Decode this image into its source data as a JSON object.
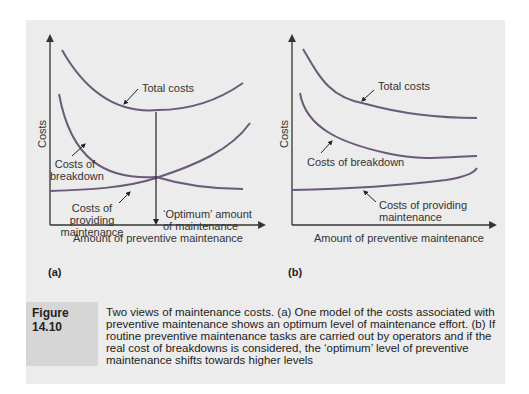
{
  "figure": {
    "label": "Figure 14.10",
    "caption": "Two views of maintenance costs. (a) One model of the costs associated with preventive maintenance shows an optimum level of maintenance effort. (b) If routine preventive maintenance tasks are carried out by operators and if the real cost of breakdowns is considered, the ‘optimum’ level of preventive maintenance shifts towards higher levels"
  },
  "panel_a": {
    "sublabel": "(a)",
    "y_axis_label": "Costs",
    "x_axis_label": "Amount of preventive maintenance",
    "curve_labels": {
      "total": "Total costs",
      "breakdown_1": "Costs of",
      "breakdown_2": "breakdown",
      "providing_1": "Costs of",
      "providing_2": "providing",
      "providing_3": "maintenance",
      "optimum_1": "‘Optimum’ amount",
      "optimum_2": "of maintenance"
    }
  },
  "panel_b": {
    "sublabel": "(b)",
    "y_axis_label": "Costs",
    "x_axis_label": "Amount of preventive maintenance",
    "curve_labels": {
      "total": "Total costs",
      "breakdown": "Costs of breakdown",
      "providing_1": "Costs of providing",
      "providing_2": "maintenance"
    }
  },
  "colors": {
    "curve": "#6b5a78",
    "axis": "#333333",
    "panel_bg": "#ececec",
    "caption_label_bg": "#d6d6d6"
  }
}
